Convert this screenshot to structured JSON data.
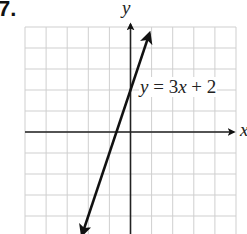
{
  "problem_number": "7.",
  "chart_data": {
    "type": "line",
    "title": "",
    "xlabel": "x",
    "ylabel": "y",
    "xlim": [
      -5,
      5
    ],
    "ylim": [
      -5,
      5
    ],
    "grid": true,
    "grid_step": 1,
    "tick_labels_shown": false,
    "series": [
      {
        "name": "y = 3x + 2",
        "equation": "y = 3x + 2",
        "slope": 3,
        "intercept": 2,
        "x": [
          -2.3,
          0.9
        ],
        "y": [
          -4.9,
          4.7
        ],
        "arrows": "both"
      }
    ],
    "annotations": [
      {
        "text": "y = 3x + 2",
        "x": 0.4,
        "y": 2.2
      }
    ]
  },
  "labels": {
    "x_axis": "x",
    "y_axis": "y",
    "equation_lhs": "y",
    "equation_eq": " = 3",
    "equation_var": "x",
    "equation_rest": " + 2"
  },
  "colors": {
    "grid": "#cfcfcf",
    "axis": "#222222",
    "line": "#111111"
  }
}
